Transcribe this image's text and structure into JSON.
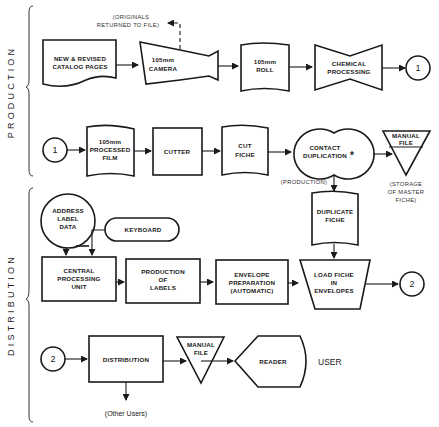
{
  "sections": {
    "production": "PRODUCTION",
    "distribution": "DISTRIBUTION"
  },
  "annotations": {
    "originals_line1": "(ORIGINALS",
    "originals_line2": "RETURNED TO FILE)",
    "production_note": "(PRODUCTION)",
    "storage_line1": "(STORAGE",
    "storage_line2": "OF MASTER",
    "storage_line3": "FICHE)",
    "contact_marker": "*",
    "other_users": "(Other Users)",
    "user": "USER"
  },
  "connectors": {
    "one": "1",
    "two": "2"
  },
  "nodes": {
    "catalog_pages": [
      "NEW & REVISED",
      "CATALOG PAGES"
    ],
    "camera": [
      "105mm",
      "CAMERA"
    ],
    "roll": [
      "105mm",
      "ROLL"
    ],
    "chemical": [
      "CHEMICAL",
      "PROCESSING"
    ],
    "processed_film": [
      "105mm",
      "PROCESSED",
      "FILM"
    ],
    "cutter": [
      "CUTTER"
    ],
    "cut_fiche": [
      "CUT",
      "FICHE"
    ],
    "contact_dup": [
      "CONTACT",
      "DUPLICATION"
    ],
    "manual_file_master": [
      "MANUAL",
      "FILE"
    ],
    "duplicate_fiche": [
      "DUPLICATE",
      "FICHE"
    ],
    "address_data": [
      "ADDRESS",
      "LABEL",
      "DATA"
    ],
    "keyboard": [
      "KEYBOARD"
    ],
    "cpu": [
      "CENTRAL",
      "PROCESSING",
      "UNIT"
    ],
    "labels": [
      "PRODUCTION",
      "OF",
      "LABELS"
    ],
    "envelope_prep": [
      "ENVELOPE",
      "PREPARATION",
      "(AUTOMATIC)"
    ],
    "load_fiche": [
      "LOAD FICHE",
      "IN",
      "ENVELOPES"
    ],
    "distribution": [
      "DISTRIBUTION"
    ],
    "manual_file_user": [
      "MANUAL",
      "FILE"
    ],
    "reader": [
      "READER"
    ]
  }
}
